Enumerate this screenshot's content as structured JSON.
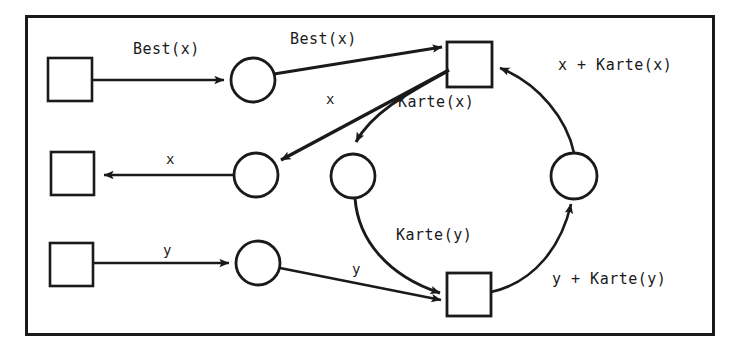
{
  "diagram": {
    "frame": {
      "x": 25,
      "y": 15,
      "width": 689,
      "height": 320,
      "stroke": "#1a1a1a",
      "stroke_width": 3
    },
    "colors": {
      "ink": "#1a1a1a",
      "paper": "#ffffff"
    },
    "transitions": [
      {
        "id": "t-left-top",
        "label": "",
        "x": 48,
        "y": 58,
        "w": 44,
        "h": 43
      },
      {
        "id": "t-left-mid",
        "label": "",
        "x": 51,
        "y": 152,
        "w": 43,
        "h": 43
      },
      {
        "id": "t-left-bottom",
        "label": "",
        "x": 50,
        "y": 243,
        "w": 43,
        "h": 43
      },
      {
        "id": "t-top-right",
        "label": "",
        "x": 447,
        "y": 42,
        "w": 45,
        "h": 45
      },
      {
        "id": "t-bottom-right",
        "label": "",
        "x": 447,
        "y": 273,
        "w": 44,
        "h": 43
      }
    ],
    "places": [
      {
        "id": "p-top-left",
        "label": "",
        "cx": 253,
        "cy": 80,
        "r": 22
      },
      {
        "id": "p-mid-left",
        "label": "",
        "cx": 256,
        "cy": 175,
        "r": 22
      },
      {
        "id": "p-bottom-left",
        "label": "",
        "cx": 258,
        "cy": 263,
        "r": 22
      },
      {
        "id": "p-center",
        "label": "",
        "cx": 353,
        "cy": 176,
        "r": 22
      },
      {
        "id": "p-right",
        "label": "",
        "cx": 574,
        "cy": 176,
        "r": 23
      }
    ],
    "arc_labels": [
      {
        "id": "arc-label-best-x-in",
        "text": "Best(x)",
        "x": 133,
        "y": 42
      },
      {
        "id": "arc-label-best-x-out",
        "text": "Best(x)",
        "x": 290,
        "y": 32
      },
      {
        "id": "arc-label-x-top",
        "text": "x",
        "x": 326,
        "y": 92
      },
      {
        "id": "arc-label-karte-x",
        "text": "Karte(x)",
        "x": 398,
        "y": 95
      },
      {
        "id": "arc-label-x-plus-karte-x",
        "text": "x + Karte(x)",
        "x": 558,
        "y": 58
      },
      {
        "id": "arc-label-x-out",
        "text": "x",
        "x": 166,
        "y": 152
      },
      {
        "id": "arc-label-karte-y",
        "text": "Karte(y)",
        "x": 396,
        "y": 228
      },
      {
        "id": "arc-label-y-in",
        "text": "y",
        "x": 163,
        "y": 243
      },
      {
        "id": "arc-label-y-mid",
        "text": "y",
        "x": 352,
        "y": 262
      },
      {
        "id": "arc-label-y-plus-karte-y",
        "text": "y + Karte(y)",
        "x": 552,
        "y": 272
      }
    ]
  }
}
